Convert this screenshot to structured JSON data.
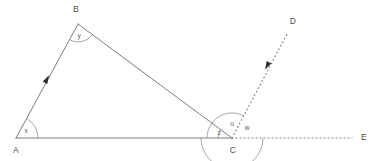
{
  "figure": {
    "kind": "geometry-diagram",
    "background_color": "#ffffff",
    "line_color": "#6d6d6d",
    "arc_color": "#8a8a8a",
    "label_color": "#4a4a4a",
    "arrow_color": "#2e2e2e",
    "width": 385,
    "height": 161
  },
  "points": {
    "A": {
      "label": "A",
      "x": 16,
      "y": 138,
      "label_x": 16,
      "label_y": 153
    },
    "B": {
      "label": "B",
      "x": 78,
      "y": 24,
      "label_x": 76,
      "label_y": 12
    },
    "C": {
      "label": "C",
      "x": 232,
      "y": 138,
      "label_x": 233,
      "label_y": 153
    },
    "D": {
      "label": "D",
      "x": 288,
      "y": 32,
      "label_x": 293,
      "label_y": 24
    },
    "E": {
      "label": "E",
      "x": 352,
      "y": 138,
      "label_x": 364,
      "label_y": 140
    }
  },
  "segments": [
    {
      "name": "AB",
      "from": "A",
      "to": "B",
      "style": "solid",
      "has_arrow": true,
      "arrow_at_x": 47,
      "arrow_at_y": 79,
      "arrow_direction": "toward-B"
    },
    {
      "name": "BC",
      "from": "B",
      "to": "C",
      "style": "solid",
      "has_arrow": false
    },
    {
      "name": "AC",
      "from": "A",
      "to": "C",
      "style": "solid",
      "has_arrow": false
    },
    {
      "name": "CD",
      "from": "C",
      "to": "D",
      "style": "dotted",
      "has_arrow": true,
      "arrow_at_x": 267,
      "arrow_at_y": 66,
      "arrow_direction": "toward-C"
    },
    {
      "name": "CE",
      "from": "C",
      "to": "E",
      "style": "dotted",
      "has_arrow": false
    }
  ],
  "angles": [
    {
      "name": "x",
      "label": "x",
      "vertex": "A",
      "radius": 22,
      "label_x": 26,
      "label_y": 133,
      "between": "AB and AC"
    },
    {
      "name": "y",
      "label": "y",
      "vertex": "B",
      "radius": 18,
      "label_x": 79,
      "label_y": 38,
      "between": "BA and BC"
    },
    {
      "name": "z",
      "label": "z",
      "vertex": "C",
      "radius": 14,
      "label_x": 219,
      "label_y": 135,
      "between": "CA and CB"
    },
    {
      "name": "u",
      "label": "u",
      "vertex": "C",
      "radius": 25,
      "label_x": 232,
      "label_y": 126,
      "between": "CB and CD"
    },
    {
      "name": "w",
      "label": "w",
      "vertex": "C",
      "radius": 31,
      "label_x": 247,
      "label_y": 130,
      "between": "CD and CE"
    }
  ]
}
